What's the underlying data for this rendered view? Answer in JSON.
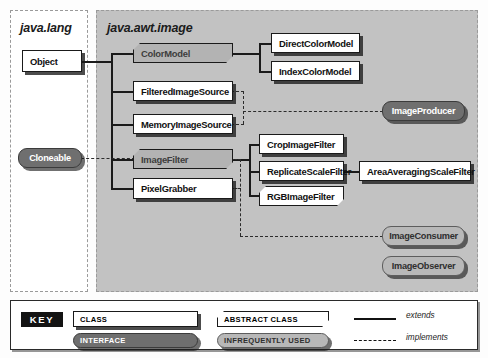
{
  "packages": [
    {
      "id": "java-lang",
      "title": "java.lang"
    },
    {
      "id": "java-awt-image",
      "title": "java.awt.image"
    }
  ],
  "nodes": [
    {
      "id": "object",
      "label": "Object",
      "kind": "class",
      "package": "java.lang"
    },
    {
      "id": "cloneable",
      "label": "Cloneable",
      "kind": "interface",
      "package": "java.lang"
    },
    {
      "id": "color-model",
      "label": "ColorModel",
      "kind": "abstract-class-infrequent",
      "package": "java.awt.image"
    },
    {
      "id": "filtered-image-source",
      "label": "FilteredImageSource",
      "kind": "class",
      "package": "java.awt.image"
    },
    {
      "id": "memory-image-source",
      "label": "MemoryImageSource",
      "kind": "class",
      "package": "java.awt.image"
    },
    {
      "id": "image-filter",
      "label": "ImageFilter",
      "kind": "abstract-class-infrequent",
      "package": "java.awt.image"
    },
    {
      "id": "pixel-grabber",
      "label": "PixelGrabber",
      "kind": "class",
      "package": "java.awt.image"
    },
    {
      "id": "direct-color-model",
      "label": "DirectColorModel",
      "kind": "class",
      "package": "java.awt.image"
    },
    {
      "id": "index-color-model",
      "label": "IndexColorModel",
      "kind": "class",
      "package": "java.awt.image"
    },
    {
      "id": "crop-image-filter",
      "label": "CropImageFilter",
      "kind": "class",
      "package": "java.awt.image"
    },
    {
      "id": "replicate-scale-filter",
      "label": "ReplicateScaleFilter",
      "kind": "class",
      "package": "java.awt.image"
    },
    {
      "id": "rgb-image-filter",
      "label": "RGBImageFilter",
      "kind": "abstract-class",
      "package": "java.awt.image"
    },
    {
      "id": "area-averaging-scale-filter",
      "label": "AreaAveragingScaleFilter",
      "kind": "class",
      "package": "java.awt.image"
    },
    {
      "id": "image-producer",
      "label": "ImageProducer",
      "kind": "interface",
      "package": "java.awt.image"
    },
    {
      "id": "image-consumer",
      "label": "ImageConsumer",
      "kind": "interface-infrequent",
      "package": "java.awt.image"
    },
    {
      "id": "image-observer",
      "label": "ImageObserver",
      "kind": "interface-infrequent",
      "package": "java.awt.image"
    }
  ],
  "relationships": [
    {
      "from": "object",
      "to": "color-model",
      "type": "extends"
    },
    {
      "from": "object",
      "to": "filtered-image-source",
      "type": "extends"
    },
    {
      "from": "object",
      "to": "memory-image-source",
      "type": "extends"
    },
    {
      "from": "object",
      "to": "image-filter",
      "type": "extends"
    },
    {
      "from": "object",
      "to": "pixel-grabber",
      "type": "extends"
    },
    {
      "from": "color-model",
      "to": "direct-color-model",
      "type": "extends"
    },
    {
      "from": "color-model",
      "to": "index-color-model",
      "type": "extends"
    },
    {
      "from": "image-filter",
      "to": "crop-image-filter",
      "type": "extends"
    },
    {
      "from": "image-filter",
      "to": "replicate-scale-filter",
      "type": "extends"
    },
    {
      "from": "image-filter",
      "to": "rgb-image-filter",
      "type": "extends"
    },
    {
      "from": "replicate-scale-filter",
      "to": "area-averaging-scale-filter",
      "type": "extends"
    },
    {
      "from": "cloneable",
      "to": "image-filter",
      "type": "implements"
    },
    {
      "from": "filtered-image-source",
      "to": "image-producer",
      "type": "implements"
    },
    {
      "from": "memory-image-source",
      "to": "image-producer",
      "type": "implements"
    },
    {
      "from": "image-filter",
      "to": "image-consumer",
      "type": "implements"
    },
    {
      "from": "pixel-grabber",
      "to": "image-consumer",
      "type": "implements"
    }
  ],
  "key": {
    "badge": "KEY",
    "items": [
      {
        "id": "class",
        "label": "CLASS"
      },
      {
        "id": "abstract-class",
        "label": "ABSTRACT CLASS"
      },
      {
        "id": "interface",
        "label": "INTERFACE"
      },
      {
        "id": "infrequently-used",
        "label": "INFREQUENTLY USED"
      }
    ],
    "lines": [
      {
        "id": "extends",
        "label": "extends",
        "style": "solid"
      },
      {
        "id": "implements",
        "label": "implements",
        "style": "dashed"
      }
    ]
  },
  "colors": {
    "package_background": "#c2c2c2",
    "class_fill": "#ffffff",
    "infrequent_fill": "#b3b3b3",
    "interface_fill": "#6f6f6f",
    "interface_infrequent_fill": "#b8b8b8",
    "stroke": "#1a1a1a"
  }
}
